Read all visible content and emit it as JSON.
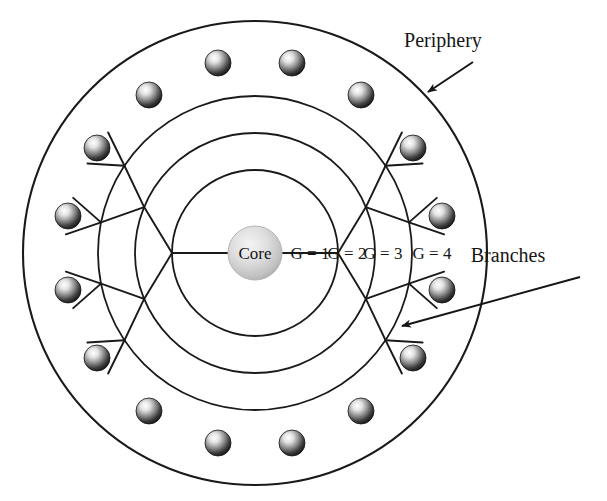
{
  "figure": {
    "type": "dendrimer-schematic",
    "title": "",
    "background_color": "#ffffff",
    "line_color": "#1a1a1a",
    "width": 607,
    "height": 501
  },
  "geometry": {
    "center_x": 255,
    "center_y": 253,
    "generation_radii": [
      83,
      120,
      157,
      232
    ],
    "periphery_node_radius": 190,
    "core_radius": 27,
    "node_radius": 13
  },
  "core": {
    "label": "Core",
    "fill_color": "#c9c9c9"
  },
  "generations": [
    {
      "label": "G = 1",
      "radius": 83,
      "label_x": 310,
      "label_y": 259
    },
    {
      "label": "G = 2",
      "radius": 120,
      "label_x": 347,
      "label_y": 259
    },
    {
      "label": "G = 3",
      "radius": 157,
      "label_x": 383,
      "label_y": 259
    },
    {
      "label": "G = 4",
      "radius": 232,
      "label_x": 432,
      "label_y": 259
    }
  ],
  "annotations": [
    {
      "name": "periphery",
      "label": "Periphery",
      "text_x": 443,
      "text_y": 47,
      "arrow_from_x": 473,
      "arrow_from_y": 62,
      "arrow_to_x": 428,
      "arrow_to_y": 92
    },
    {
      "name": "branches",
      "label": "Branches",
      "text_x": 508,
      "text_y": 262,
      "arrow_from_x": 580,
      "arrow_from_y": 277,
      "arrow_to_x": 402,
      "arrow_to_y": 326
    }
  ],
  "node_colors": {
    "highlight": "#ffffff",
    "mid": "#8c8c8c",
    "shadow": "#1d1d1d",
    "core_highlight": "#ebebeb",
    "core_mid": "#cfcfcf",
    "core_shadow": "#a5a5a5"
  },
  "tree": {
    "description": "Binary dendrimer: 2 primary branches from core, each splitting at every generation ring, terminating in 16 peripheral spheres.",
    "root_branch_angles_deg": [
      -90,
      90
    ],
    "generation_branch_counts": [
      2,
      4,
      8,
      16
    ],
    "peripheral_node_count": 16
  },
  "peripheral_nodes": [
    {
      "id": 1,
      "angle_deg": -101.25,
      "x": 218,
      "y": 63
    },
    {
      "id": 2,
      "angle_deg": -78.75,
      "x": 292,
      "y": 63
    },
    {
      "id": 3,
      "angle_deg": -123.75,
      "x": 149,
      "y": 95
    },
    {
      "id": 4,
      "angle_deg": -56.25,
      "x": 361,
      "y": 95
    },
    {
      "id": 5,
      "angle_deg": -146.25,
      "x": 97,
      "y": 148
    },
    {
      "id": 6,
      "angle_deg": -33.75,
      "x": 413,
      "y": 148
    },
    {
      "id": 7,
      "angle_deg": -168.75,
      "x": 68,
      "y": 216
    },
    {
      "id": 8,
      "angle_deg": -11.25,
      "x": 442,
      "y": 216
    },
    {
      "id": 9,
      "angle_deg": 168.75,
      "x": 68,
      "y": 290
    },
    {
      "id": 10,
      "angle_deg": 11.25,
      "x": 442,
      "y": 290
    },
    {
      "id": 11,
      "angle_deg": 146.25,
      "x": 97,
      "y": 358
    },
    {
      "id": 12,
      "angle_deg": 33.75,
      "x": 413,
      "y": 358
    },
    {
      "id": 13,
      "angle_deg": 123.75,
      "x": 149,
      "y": 411
    },
    {
      "id": 14,
      "angle_deg": 56.25,
      "x": 361,
      "y": 411
    },
    {
      "id": 15,
      "angle_deg": 101.25,
      "x": 218,
      "y": 443
    },
    {
      "id": 16,
      "angle_deg": 78.75,
      "x": 292,
      "y": 443
    }
  ]
}
